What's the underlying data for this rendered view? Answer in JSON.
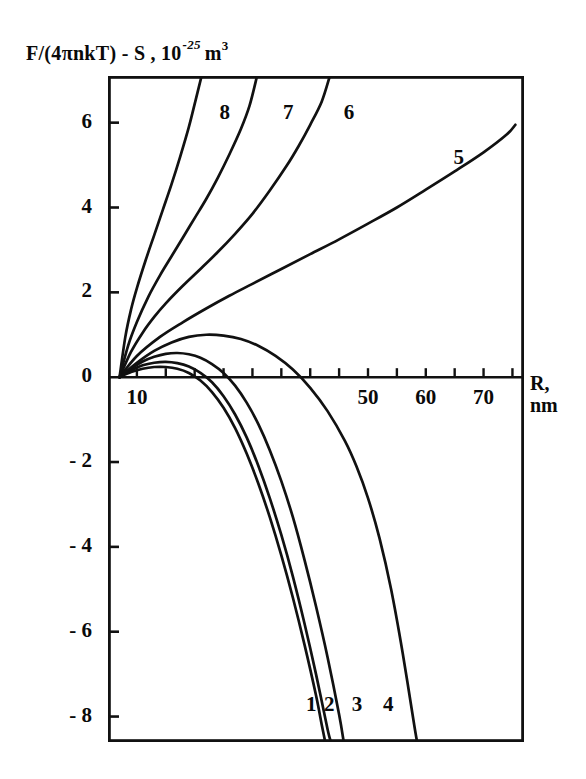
{
  "figure": {
    "ylabel_parts": {
      "main": "F/(4πnkT) - S ,",
      "mantissa": "10",
      "exponent": "-25",
      "unit": "m",
      "unit_exp": "3"
    },
    "xaxis_name_line1": "R,",
    "xaxis_name_line2": "nm"
  },
  "chart_data": {
    "type": "line",
    "title": "",
    "xlabel": "R, nm",
    "ylabel": "F/(4πnkT) - S , 10^-25 m^3",
    "xlim": [
      5,
      77
    ],
    "ylim": [
      -8.6,
      7.1
    ],
    "xticks": [
      5,
      10,
      15,
      20,
      25,
      30,
      35,
      40,
      45,
      50,
      55,
      60,
      65,
      70,
      75
    ],
    "xticklabels": [
      "",
      "10",
      "",
      "",
      "",
      "",
      "",
      "",
      "",
      "50",
      "",
      "60",
      "",
      "70",
      ""
    ],
    "yticks": [
      6,
      4,
      2,
      0,
      -2,
      -4,
      -6,
      -8
    ],
    "yticklabels": [
      "6",
      "4",
      "2",
      "0",
      "- 2",
      "- 4",
      "- 6",
      "- 8"
    ],
    "grid": false,
    "legend": "inline-curve-numbers",
    "series": [
      {
        "name": "1",
        "label": "1",
        "label_x": 40.5,
        "label_y": -7.75,
        "points": [
          [
            7,
            0
          ],
          [
            9,
            0.12
          ],
          [
            11,
            0.2
          ],
          [
            13,
            0.24
          ],
          [
            15,
            0.24
          ],
          [
            17,
            0.2
          ],
          [
            19,
            0.1
          ],
          [
            21,
            -0.08
          ],
          [
            23,
            -0.35
          ],
          [
            25,
            -0.72
          ],
          [
            27,
            -1.2
          ],
          [
            29,
            -1.8
          ],
          [
            31,
            -2.5
          ],
          [
            33,
            -3.3
          ],
          [
            35,
            -4.2
          ],
          [
            37,
            -5.2
          ],
          [
            39,
            -6.3
          ],
          [
            41,
            -7.5
          ],
          [
            42,
            -8.2
          ],
          [
            42.6,
            -8.6
          ]
        ]
      },
      {
        "name": "2",
        "label": "2",
        "label_x": 43.6,
        "label_y": -7.75,
        "points": [
          [
            7,
            0
          ],
          [
            9,
            0.16
          ],
          [
            11,
            0.28
          ],
          [
            13,
            0.34
          ],
          [
            15,
            0.36
          ],
          [
            17,
            0.33
          ],
          [
            19,
            0.25
          ],
          [
            21,
            0.1
          ],
          [
            23,
            -0.12
          ],
          [
            25,
            -0.45
          ],
          [
            27,
            -0.88
          ],
          [
            29,
            -1.42
          ],
          [
            31,
            -2.08
          ],
          [
            33,
            -2.85
          ],
          [
            35,
            -3.72
          ],
          [
            37,
            -4.7
          ],
          [
            39,
            -5.8
          ],
          [
            41,
            -7.0
          ],
          [
            43,
            -8.3
          ],
          [
            43.6,
            -8.6
          ]
        ]
      },
      {
        "name": "3",
        "label": "3",
        "label_x": 48.4,
        "label_y": -7.75,
        "points": [
          [
            7,
            0
          ],
          [
            9,
            0.2
          ],
          [
            11,
            0.37
          ],
          [
            13,
            0.48
          ],
          [
            15,
            0.55
          ],
          [
            17,
            0.57
          ],
          [
            19,
            0.54
          ],
          [
            21,
            0.46
          ],
          [
            23,
            0.31
          ],
          [
            25,
            0.1
          ],
          [
            27,
            -0.2
          ],
          [
            29,
            -0.6
          ],
          [
            31,
            -1.1
          ],
          [
            33,
            -1.72
          ],
          [
            35,
            -2.45
          ],
          [
            37,
            -3.3
          ],
          [
            39,
            -4.3
          ],
          [
            41,
            -5.4
          ],
          [
            43,
            -6.6
          ],
          [
            45,
            -7.95
          ],
          [
            45.8,
            -8.6
          ]
        ]
      },
      {
        "name": "4",
        "label": "4",
        "label_x": 53.8,
        "label_y": -7.75,
        "points": [
          [
            7,
            0
          ],
          [
            10,
            0.34
          ],
          [
            13,
            0.62
          ],
          [
            16,
            0.82
          ],
          [
            19,
            0.95
          ],
          [
            22,
            1.0
          ],
          [
            25,
            0.98
          ],
          [
            28,
            0.9
          ],
          [
            31,
            0.74
          ],
          [
            34,
            0.5
          ],
          [
            37,
            0.18
          ],
          [
            40,
            -0.25
          ],
          [
            43,
            -0.8
          ],
          [
            46,
            -1.5
          ],
          [
            48,
            -2.1
          ],
          [
            50,
            -2.85
          ],
          [
            52,
            -3.8
          ],
          [
            54,
            -5.0
          ],
          [
            56,
            -6.5
          ],
          [
            58,
            -8.2
          ],
          [
            58.5,
            -8.6
          ]
        ]
      },
      {
        "name": "5",
        "label": "5",
        "label_x": 66.0,
        "label_y": 5.15,
        "points": [
          [
            7,
            0
          ],
          [
            10,
            0.5
          ],
          [
            14,
            0.95
          ],
          [
            18,
            1.3
          ],
          [
            22,
            1.62
          ],
          [
            26,
            1.92
          ],
          [
            30,
            2.2
          ],
          [
            35,
            2.55
          ],
          [
            40,
            2.9
          ],
          [
            45,
            3.25
          ],
          [
            50,
            3.62
          ],
          [
            55,
            4.0
          ],
          [
            60,
            4.42
          ],
          [
            65,
            4.85
          ],
          [
            70,
            5.3
          ],
          [
            74,
            5.72
          ],
          [
            75.5,
            5.95
          ]
        ]
      },
      {
        "name": "6",
        "label": "6",
        "label_x": 47.0,
        "label_y": 6.2,
        "points": [
          [
            7,
            0
          ],
          [
            9,
            0.6
          ],
          [
            11,
            1.05
          ],
          [
            13,
            1.42
          ],
          [
            15,
            1.74
          ],
          [
            18,
            2.16
          ],
          [
            21,
            2.55
          ],
          [
            24,
            2.95
          ],
          [
            27,
            3.38
          ],
          [
            30,
            3.85
          ],
          [
            33,
            4.4
          ],
          [
            36,
            5.0
          ],
          [
            38,
            5.45
          ],
          [
            40,
            5.95
          ],
          [
            42,
            6.5
          ],
          [
            43.4,
            7.1
          ]
        ]
      },
      {
        "name": "7",
        "label": "7",
        "label_x": 36.5,
        "label_y": 6.2,
        "points": [
          [
            7,
            0
          ],
          [
            8.5,
            0.75
          ],
          [
            10,
            1.3
          ],
          [
            12,
            1.9
          ],
          [
            14,
            2.4
          ],
          [
            16,
            2.85
          ],
          [
            18,
            3.3
          ],
          [
            20,
            3.75
          ],
          [
            22,
            4.2
          ],
          [
            24,
            4.7
          ],
          [
            26,
            5.25
          ],
          [
            28,
            5.85
          ],
          [
            29.5,
            6.4
          ],
          [
            30.8,
            7.1
          ]
        ]
      },
      {
        "name": "8",
        "label": "8",
        "label_x": 25.5,
        "label_y": 6.2,
        "points": [
          [
            7,
            0
          ],
          [
            8,
            0.95
          ],
          [
            9,
            1.6
          ],
          [
            10,
            2.1
          ],
          [
            11.5,
            2.75
          ],
          [
            13,
            3.35
          ],
          [
            14.5,
            3.95
          ],
          [
            16,
            4.55
          ],
          [
            17.5,
            5.2
          ],
          [
            19,
            5.9
          ],
          [
            20.2,
            6.55
          ],
          [
            21.2,
            7.1
          ]
        ]
      }
    ]
  }
}
